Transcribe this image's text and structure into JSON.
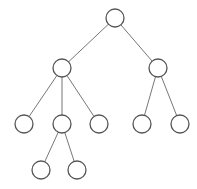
{
  "diagram": {
    "type": "tree",
    "background": "#ffffff",
    "stroke_color": "#555555",
    "edge_color": "#777777",
    "node_radius": 9,
    "nodes": [
      {
        "id": "root",
        "x": 115,
        "y": 18,
        "label": ""
      },
      {
        "id": "a",
        "x": 62,
        "y": 68,
        "label": ""
      },
      {
        "id": "b",
        "x": 158,
        "y": 68,
        "label": ""
      },
      {
        "id": "a1",
        "x": 24,
        "y": 124,
        "label": ""
      },
      {
        "id": "a2",
        "x": 62,
        "y": 124,
        "label": ""
      },
      {
        "id": "a3",
        "x": 99,
        "y": 124,
        "label": ""
      },
      {
        "id": "b1",
        "x": 142,
        "y": 124,
        "label": ""
      },
      {
        "id": "b2",
        "x": 180,
        "y": 124,
        "label": ""
      },
      {
        "id": "a2a",
        "x": 41,
        "y": 170,
        "label": ""
      },
      {
        "id": "a2b",
        "x": 77,
        "y": 170,
        "label": ""
      }
    ],
    "edges": [
      [
        "root",
        "a"
      ],
      [
        "root",
        "b"
      ],
      [
        "a",
        "a1"
      ],
      [
        "a",
        "a2"
      ],
      [
        "a",
        "a3"
      ],
      [
        "b",
        "b1"
      ],
      [
        "b",
        "b2"
      ],
      [
        "a2",
        "a2a"
      ],
      [
        "a2",
        "a2b"
      ]
    ]
  }
}
